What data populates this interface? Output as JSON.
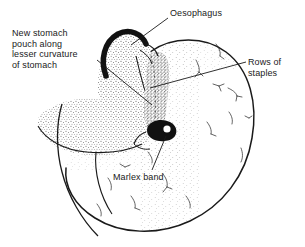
{
  "figure": {
    "subject": "stomach",
    "style": "black-and-white stippled medical line drawing",
    "background_color": "#ffffff",
    "ink_color": "#1a1a1a"
  },
  "labels": {
    "oesophagus": "Oesophagus",
    "new_pouch": "New stomach\npouch along\nlesser curvature\nof stomach",
    "rows_of_staples": "Rows of\nstaples",
    "marlex_band": "Marlex band"
  },
  "annotations": [
    {
      "id": "oesophagus",
      "text": "Oesophagus",
      "leader_from": [
        168,
        18
      ],
      "leader_to": [
        131,
        45
      ]
    },
    {
      "id": "new-pouch",
      "text": "New stomach pouch along lesser curvature of stomach",
      "leader_from": [
        97,
        60
      ],
      "leader_to": [
        152,
        105
      ]
    },
    {
      "id": "rows-of-staples",
      "text": "Rows of staples",
      "leader_from": [
        246,
        62
      ],
      "leader_to": [
        150,
        88
      ]
    },
    {
      "id": "marlex-band",
      "text": "Marlex band",
      "leader_from": [
        152,
        170
      ],
      "leader_to": [
        166,
        136
      ]
    }
  ],
  "structures": [
    {
      "name": "oesophagus",
      "description": "dark thick crescent tube entering stomach at top"
    },
    {
      "name": "stomach-body",
      "description": "large rounded fundus and body outline, lightly stippled"
    },
    {
      "name": "staple-line",
      "description": "dense vertical stippled band of staple rows"
    },
    {
      "name": "marlex-band",
      "description": "dark filled ring forming stoma at pouch outlet"
    },
    {
      "name": "greater-curvature",
      "description": "lower-left sweeping curve with omentum"
    },
    {
      "name": "vessels",
      "description": "small branching vessel marks across stomach wall"
    }
  ]
}
